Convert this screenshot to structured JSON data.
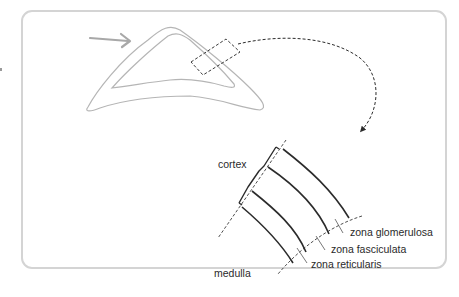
{
  "diagram": {
    "type": "anatomical-illustration",
    "labels": {
      "cortex": "cortex",
      "medulla": "medulla",
      "zona_glomerulosa": "zona glomerulosa",
      "zona_fasciculata": "zona fasciculata",
      "zona_reticularis": "zona reticularis"
    },
    "colors": {
      "panel_border": "#d4d4d4",
      "gland_outline": "#b5b5b5",
      "pointer_arrow": "#a8a8a8",
      "line_dark": "#2b2b2b",
      "text": "#2a2a2a"
    }
  }
}
